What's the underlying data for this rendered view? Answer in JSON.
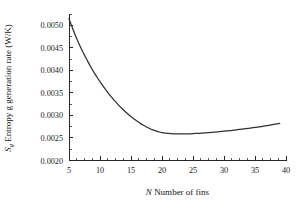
{
  "chart_data": {
    "type": "line",
    "title": "",
    "xlabel": "N  Number of fins",
    "xlabel_italic_part": "N",
    "xlabel_rest": "Number of fins",
    "ylabel": "Ṡg  Entropy g generation rate (W/K)",
    "ylabel_symbol": "S",
    "ylabel_subscript": "g",
    "ylabel_rest": " Entropy g generation rate (W/K)",
    "xlim": [
      5,
      40
    ],
    "ylim": [
      0.002,
      0.00525
    ],
    "xticks": [
      5,
      10,
      15,
      20,
      25,
      30,
      35,
      40
    ],
    "xtick_labels": [
      "5",
      "10",
      "15",
      "20",
      "25",
      "30",
      "35",
      "40"
    ],
    "x_minor_interval": 1.25,
    "yticks": [
      0.002,
      0.0025,
      0.003,
      0.0035,
      0.004,
      0.0045,
      0.005
    ],
    "ytick_labels": [
      "0.0020",
      "0.0025",
      "0.0030",
      "0.0035",
      "0.0040",
      "0.0045",
      "0.0050"
    ],
    "y_minor_interval": 0.00025,
    "grid": false,
    "legend": "none",
    "axis_style": "open-left-bottom",
    "line_color": "#303030",
    "background_color": "#ffffff",
    "x": [
      5,
      5.5,
      6,
      6.5,
      7,
      7.5,
      8,
      8.5,
      9,
      9.5,
      10,
      10.5,
      11,
      11.5,
      12,
      12.5,
      13,
      13.5,
      14,
      14.5,
      15,
      15.5,
      16,
      16.5,
      17,
      17.5,
      18,
      18.5,
      19,
      19.5,
      20,
      21,
      22,
      23,
      24,
      25,
      26,
      27,
      28,
      29,
      30,
      31,
      32,
      33,
      34,
      35,
      36,
      37,
      38,
      39
    ],
    "values": [
      0.00515,
      0.00496,
      0.004785,
      0.004625,
      0.004475,
      0.004335,
      0.004205,
      0.00408,
      0.003962,
      0.003852,
      0.003748,
      0.00365,
      0.003556,
      0.003468,
      0.003384,
      0.003305,
      0.00323,
      0.00316,
      0.003094,
      0.003032,
      0.002974,
      0.00292,
      0.00287,
      0.002824,
      0.002782,
      0.002744,
      0.00271,
      0.002681,
      0.002656,
      0.002636,
      0.00262,
      0.0026,
      0.002592,
      0.00259,
      0.002592,
      0.002597,
      0.002604,
      0.002613,
      0.002624,
      0.002636,
      0.00265,
      0.002664,
      0.00268,
      0.002697,
      0.002715,
      0.002734,
      0.002754,
      0.002776,
      0.002799,
      0.002823
    ],
    "series_name": "entropy generation rate",
    "minimum_point": {
      "x": 23,
      "y": 0.00259
    },
    "start_point": {
      "x": 5,
      "y": 0.00515
    },
    "end_point": {
      "x": 39,
      "y": 0.00282
    }
  }
}
